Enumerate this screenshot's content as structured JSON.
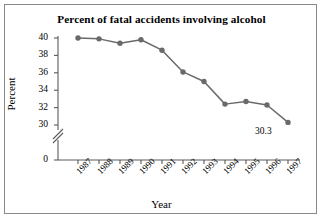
{
  "figure": {
    "border_color": "#8a8a8a",
    "background": "#ffffff"
  },
  "chart_data": {
    "type": "line",
    "title": "Percent of fatal accidents involving alcohol",
    "xlabel": "Year",
    "ylabel": "Percent",
    "categories": [
      "1987",
      "1988",
      "1989",
      "1990",
      "1991",
      "1992",
      "1993",
      "1994",
      "1995",
      "1996",
      "1997"
    ],
    "values": [
      40.0,
      39.9,
      39.4,
      39.8,
      38.6,
      36.1,
      35.0,
      32.4,
      32.7,
      32.3,
      30.3
    ],
    "series": [
      {
        "name": "Percent of fatal accidents involving alcohol",
        "values": [
          40.0,
          39.9,
          39.4,
          39.8,
          38.6,
          36.1,
          35.0,
          32.4,
          32.7,
          32.3,
          30.3
        ],
        "color": "#6a6a6a"
      }
    ],
    "y_tick_labels": [
      "40",
      "38",
      "36",
      "34",
      "32",
      "30",
      "0"
    ],
    "y_tick_values": [
      40,
      38,
      36,
      34,
      32,
      30,
      0
    ],
    "ylim": [
      30,
      40
    ],
    "axis_break": true,
    "axis_break_between": [
      0,
      30
    ],
    "grid": false,
    "legend": "none",
    "annotations": [
      {
        "text": "30.3",
        "for_category": "1997",
        "value": 30.3
      }
    ],
    "marker": "circle",
    "marker_color": "#6a6a6a",
    "line_color": "#6a6a6a"
  }
}
